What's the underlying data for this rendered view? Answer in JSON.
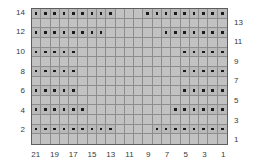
{
  "chart_data": {
    "type": "heatmap",
    "title": "",
    "xlabel": "",
    "ylabel": "",
    "columns": 21,
    "rows": 14,
    "column_order": "right-to-left",
    "row_order": "bottom-to-top",
    "symbol": "dot",
    "symbol_meaning": "purl",
    "blank_meaning": "knit",
    "colors": {
      "grid_background": "#b9b9b9",
      "grid_line": "#8d8d8d",
      "border": "#5d5d5d",
      "symbol": "#1a1a1a",
      "label": "#3a3a3a",
      "page_background": "#ffffff"
    },
    "left_axis_ticks": [
      14,
      12,
      10,
      8,
      6,
      4,
      2
    ],
    "right_axis_ticks": [
      13,
      11,
      9,
      7,
      5,
      3,
      1
    ],
    "bottom_axis_ticks": [
      21,
      19,
      17,
      15,
      13,
      11,
      9,
      7,
      5,
      3,
      1
    ],
    "row_labels_all": [
      14,
      13,
      12,
      11,
      10,
      9,
      8,
      7,
      6,
      5,
      4,
      3,
      2,
      1
    ],
    "column_labels_all": [
      21,
      20,
      19,
      18,
      17,
      16,
      15,
      14,
      13,
      12,
      11,
      10,
      9,
      8,
      7,
      6,
      5,
      4,
      3,
      2,
      1
    ],
    "rows_data": [
      {
        "row": 14,
        "dot_columns": [
          21,
          20,
          19,
          18,
          17,
          16,
          15,
          14,
          13,
          9,
          8,
          7,
          6,
          5,
          4,
          3,
          2,
          1
        ]
      },
      {
        "row": 13,
        "dot_columns": []
      },
      {
        "row": 12,
        "dot_columns": [
          21,
          20,
          19,
          18,
          17,
          16,
          15,
          14,
          7,
          6,
          5,
          4,
          3,
          2,
          1
        ]
      },
      {
        "row": 11,
        "dot_columns": []
      },
      {
        "row": 10,
        "dot_columns": [
          21,
          20,
          19,
          18,
          17,
          5,
          4,
          3,
          2,
          1
        ]
      },
      {
        "row": 9,
        "dot_columns": []
      },
      {
        "row": 8,
        "dot_columns": [
          21,
          20,
          19,
          18,
          17,
          5,
          4,
          3,
          2,
          1
        ]
      },
      {
        "row": 7,
        "dot_columns": []
      },
      {
        "row": 6,
        "dot_columns": [
          21,
          20,
          19,
          18,
          17,
          5,
          4,
          3,
          2,
          1
        ]
      },
      {
        "row": 5,
        "dot_columns": []
      },
      {
        "row": 4,
        "dot_columns": [
          21,
          20,
          19,
          18,
          17,
          16,
          6,
          5,
          4,
          3,
          2,
          1
        ]
      },
      {
        "row": 3,
        "dot_columns": []
      },
      {
        "row": 2,
        "dot_columns": [
          21,
          20,
          19,
          18,
          17,
          16,
          15,
          14,
          13,
          8,
          7,
          6,
          5,
          4,
          3,
          2,
          1
        ]
      },
      {
        "row": 1,
        "dot_columns": []
      }
    ]
  },
  "layout": {
    "grid_left": 31,
    "grid_top": 8,
    "grid_width": 197,
    "grid_height": 137
  }
}
